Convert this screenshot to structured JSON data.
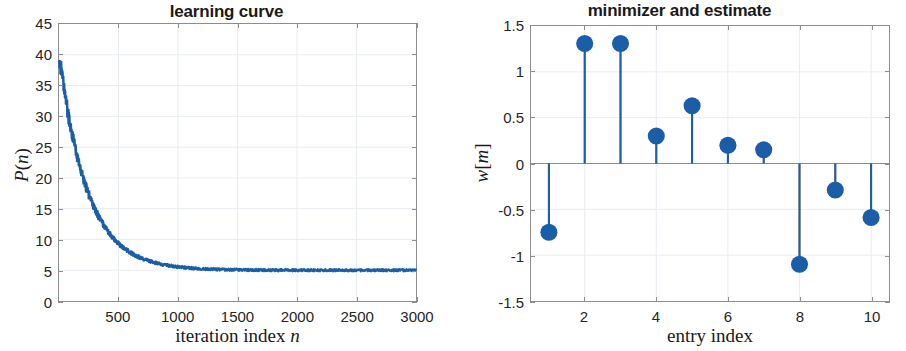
{
  "figure": {
    "width": 906,
    "height": 351,
    "background": "#ffffff",
    "series_color_blue": "#1a5ea8",
    "series_color_orange": "#d95319",
    "grid_color": "#e8edf2",
    "axis_color": "#8d8d8d"
  },
  "left": {
    "title": "learning curve",
    "xlabel_main": "iteration index",
    "xlabel_var": "n",
    "ylabel_main": "P",
    "ylabel_open": "(",
    "ylabel_var": "n",
    "ylabel_close": ")",
    "y_ticks": [
      "0",
      "5",
      "10",
      "15",
      "20",
      "25",
      "30",
      "35",
      "40",
      "45"
    ],
    "x_ticks": [
      "500",
      "1000",
      "1500",
      "2000",
      "2500",
      "3000"
    ]
  },
  "right": {
    "title": "minimizer and estimate",
    "xlabel": "entry index",
    "ylabel_main": "w",
    "ylabel_open": "[",
    "ylabel_var": "m",
    "ylabel_close": "]",
    "y_ticks": [
      "-1.5",
      "-1",
      "-0.5",
      "0",
      "0.5",
      "1",
      "1.5"
    ],
    "x_ticks": [
      "2",
      "4",
      "6",
      "8",
      "10"
    ],
    "legend": {
      "position": "top-right",
      "items": [
        {
          "label": "minimizer",
          "marker": "square-open-icon",
          "color": "#d95319"
        },
        {
          "label": "estimate",
          "marker": "circle-filled-icon",
          "color": "#1a5ea8"
        }
      ]
    }
  },
  "chart_data": [
    {
      "type": "line",
      "title": "learning curve",
      "xlabel": "iteration index n",
      "ylabel": "P(n)",
      "xlim": [
        0,
        3000
      ],
      "ylim": [
        0,
        45
      ],
      "grid": true,
      "legend": null,
      "series": [
        {
          "name": "P(n)",
          "color": "#1a5ea8",
          "description": "noisy exponentially-decaying learning curve from about 40 at n=0 to a steady-state plateau of about 5 after n~1200",
          "model": {
            "form": "P(n) = plateau + (start - plateau) * exp(-n / tau) + noise",
            "start": 40,
            "plateau": 5,
            "tau": 240,
            "noise_amplitude": 0.6
          },
          "x": [
            0,
            25,
            50,
            75,
            100,
            150,
            200,
            250,
            300,
            350,
            400,
            450,
            500,
            600,
            700,
            800,
            900,
            1000,
            1100,
            1200,
            1400,
            1600,
            1800,
            2000,
            2200,
            2400,
            2600,
            2800,
            3000
          ],
          "y": [
            40.0,
            37.5,
            34.8,
            32.2,
            29.8,
            25.7,
            22.2,
            19.3,
            16.9,
            14.9,
            13.1,
            11.7,
            10.5,
            8.6,
            7.3,
            6.5,
            5.9,
            5.6,
            5.3,
            5.2,
            5.1,
            5.0,
            5.0,
            5.0,
            5.0,
            5.0,
            5.0,
            5.0,
            5.0
          ]
        }
      ]
    },
    {
      "type": "bar",
      "subtype": "stem",
      "title": "minimizer and estimate",
      "xlabel": "entry index",
      "ylabel": "w[m]",
      "xlim": [
        0.5,
        10.5
      ],
      "ylim": [
        -1.5,
        1.5
      ],
      "grid": true,
      "legend_position": "top-right",
      "categories": [
        1,
        2,
        3,
        4,
        5,
        6,
        7,
        8,
        9,
        10
      ],
      "series": [
        {
          "name": "minimizer",
          "color": "#d95319",
          "marker": "square-open",
          "values": [
            -0.75,
            1.31,
            1.31,
            0.3,
            0.63,
            0.2,
            0.15,
            -1.1,
            -0.29,
            -0.59
          ]
        },
        {
          "name": "estimate",
          "color": "#1a5ea8",
          "marker": "circle-filled",
          "values": [
            -0.75,
            1.31,
            1.31,
            0.3,
            0.63,
            0.2,
            0.15,
            -1.1,
            -0.29,
            -0.59
          ]
        }
      ]
    }
  ]
}
